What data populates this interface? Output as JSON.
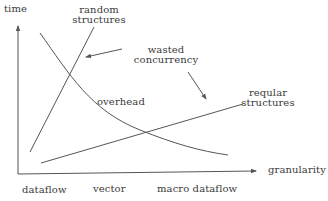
{
  "diagram": {
    "axes": {
      "y_label": "time",
      "x_label": "granularity"
    },
    "x_ticks": [
      "dataflow",
      "vector",
      "macro dataflow"
    ],
    "curves": [
      {
        "name": "random-structures",
        "label_line1": "random",
        "label_line2": "structures"
      },
      {
        "name": "overhead",
        "label": "overhead"
      },
      {
        "name": "regular-structures",
        "label_line1": "reqular",
        "label_line2": "structures"
      }
    ],
    "annotation": {
      "label_line1": "wasted",
      "label_line2": "concurrency"
    },
    "colors": {
      "line": "#555555",
      "text": "#3a3a3a",
      "background": "#ffffff"
    }
  }
}
